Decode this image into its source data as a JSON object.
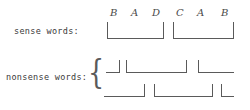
{
  "figure": {
    "width": 250,
    "height": 110,
    "background": "#ffffff",
    "ink_color": "#5a5a5a",
    "text_color": "#3a3a3a"
  },
  "labels": {
    "sense": "sense words:",
    "nonsense": "nonsense words:",
    "brace_glyph": "{"
  },
  "phoneme_sequence": {
    "letters": [
      "B",
      "A",
      "D",
      "C",
      "A",
      "B"
    ],
    "positions_x": [
      110,
      131,
      152,
      176,
      197,
      221
    ],
    "positions_y": 8
  },
  "sense_brackets": [
    {
      "id": "sense-bracket-1",
      "letters": "B A D",
      "x": 107,
      "y": 22,
      "width": 57,
      "height": 17
    },
    {
      "id": "sense-bracket-2",
      "letters": "C A B",
      "x": 173,
      "y": 22,
      "width": 61,
      "height": 17
    }
  ],
  "nonsense_rows": [
    {
      "id": "nonsense-row-1",
      "y": 60,
      "segments": [
        {
          "id": "nonsense-r1-seg-1",
          "type": "jbracket",
          "x": 106,
          "y": 60,
          "width": 14,
          "height": 13
        },
        {
          "id": "nonsense-r1-seg-2",
          "type": "ubracket",
          "x": 126,
          "y": 60,
          "width": 61,
          "height": 13
        },
        {
          "id": "nonsense-r1-seg-3",
          "type": "lbracket",
          "x": 198,
          "y": 60,
          "width": 36,
          "height": 13
        }
      ]
    },
    {
      "id": "nonsense-row-2",
      "y": 84,
      "segments": [
        {
          "id": "nonsense-r2-seg-1",
          "type": "jbracket",
          "x": 104,
          "y": 84,
          "width": 41,
          "height": 13
        },
        {
          "id": "nonsense-r2-seg-2",
          "type": "ubracket",
          "x": 154,
          "y": 84,
          "width": 59,
          "height": 13
        },
        {
          "id": "nonsense-r2-seg-3",
          "type": "lbracket",
          "x": 221,
          "y": 84,
          "width": 13,
          "height": 13
        }
      ]
    }
  ],
  "brace": {
    "x": 88,
    "y": 52,
    "height": 50
  }
}
